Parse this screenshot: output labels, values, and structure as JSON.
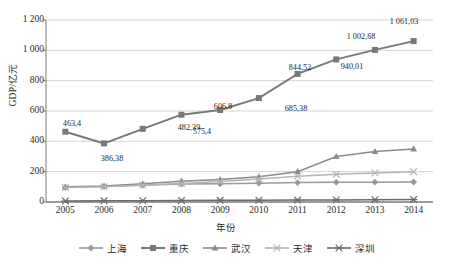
{
  "chart_data": {
    "type": "line",
    "title": "",
    "xlabel": "年份",
    "ylabel": "GDP/亿元",
    "grid": true,
    "legend_position": "bottom",
    "x": [
      "2005",
      "2006",
      "2007",
      "2008",
      "2009",
      "2010",
      "2011",
      "2012",
      "2013",
      "2014"
    ],
    "categories": [
      "2005",
      "2006",
      "2007",
      "2008",
      "2009",
      "2010",
      "2011",
      "2012",
      "2013",
      "2014"
    ],
    "ylim": [
      0,
      1200
    ],
    "yticks": [
      "0",
      "200",
      "400",
      "600",
      "800",
      "1 000",
      "1 200"
    ],
    "ytick_values": [
      0,
      200,
      400,
      600,
      800,
      1000,
      1200
    ],
    "series": [
      {
        "name": "上海",
        "marker": "diamond",
        "color": "#9a9a9a",
        "values": [
          97,
          102,
          110,
          118,
          120,
          124,
          128,
          130,
          131,
          132
        ],
        "labels": [
          "",
          "",
          "",
          "",
          "",
          "",
          "",
          "",
          "",
          ""
        ]
      },
      {
        "name": "重庆",
        "marker": "square",
        "color": "#787878",
        "values": [
          463.4,
          386.38,
          482.39,
          575.4,
          606.8,
          685.38,
          844.52,
          940.01,
          1002.68,
          1061.03
        ],
        "labels": [
          "463,4",
          "386,38",
          "482,39",
          "575,4",
          "606,8",
          "685,38",
          "844,52",
          "940,01",
          "1 002,68",
          "1 061,03"
        ]
      },
      {
        "name": "武汉",
        "marker": "triangle",
        "color": "#8b8b8b",
        "values": [
          100,
          106,
          120,
          137,
          148,
          166,
          200,
          300,
          333,
          350
        ],
        "labels": [
          "",
          "",
          "",
          "",
          "",
          "",
          "",
          "",
          "",
          ""
        ]
      },
      {
        "name": "天津",
        "marker": "cross",
        "color": "#b5b5b5",
        "values": [
          96,
          100,
          112,
          122,
          135,
          152,
          170,
          183,
          192,
          200
        ],
        "labels": [
          "",
          "",
          "",
          "",
          "",
          "",
          "",
          "",
          "",
          ""
        ]
      },
      {
        "name": "深圳",
        "marker": "asterisk",
        "color": "#6b6b6b",
        "values": [
          7,
          8,
          9,
          10,
          11,
          12,
          13,
          14,
          15,
          16
        ],
        "labels": [
          "",
          "",
          "",
          "",
          "",
          "",
          "",
          "",
          "",
          ""
        ]
      }
    ],
    "point_labels": [
      {
        "text": "463,4",
        "x": 72,
        "y": 120
      },
      {
        "text": "386,38",
        "x": 112,
        "y": 155
      },
      {
        "text": "482,39",
        "x": 189,
        "y": 124
      },
      {
        "text": "575,4",
        "x": 202,
        "y": 128
      },
      {
        "text": "606,8",
        "x": 223,
        "y": 103
      },
      {
        "text": "685,38",
        "x": 296,
        "y": 105
      },
      {
        "text": "844,52",
        "x": 300,
        "y": 64
      },
      {
        "text": "940,01",
        "x": 352,
        "y": 63
      },
      {
        "text": "1 002,68",
        "x": 361,
        "y": 33
      },
      {
        "text": "1 061,03",
        "x": 404,
        "y": 18
      }
    ]
  }
}
